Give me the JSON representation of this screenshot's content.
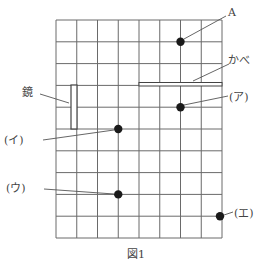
{
  "figure": {
    "caption": "図1",
    "grid": {
      "left": 56,
      "top": 20,
      "cols": 8,
      "rows": 10,
      "cell_w": 20.75,
      "cell_h": 21.8,
      "line_color": "#666666"
    },
    "mirror": {
      "label": "鏡",
      "col_line_x": 71,
      "width": 6,
      "from_row": 3,
      "to_row": 5
    },
    "wall": {
      "label": "かべ",
      "from_col": 4,
      "to_col": 8,
      "row": 3
    },
    "points": [
      {
        "id": "A",
        "label": "A",
        "col": 6,
        "row": 1
      },
      {
        "id": "a",
        "label": "(ア)",
        "col": 6,
        "row": 4
      },
      {
        "id": "i",
        "label": "(イ)",
        "col": 3,
        "row": 5
      },
      {
        "id": "u",
        "label": "(ウ)",
        "col": 3,
        "row": 8
      },
      {
        "id": "e",
        "label": "(エ)",
        "col": 8,
        "row": 9
      }
    ]
  }
}
